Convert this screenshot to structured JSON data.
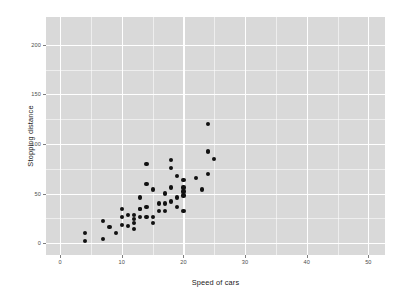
{
  "chart_data": {
    "type": "scatter",
    "title": "",
    "subtitle": "",
    "xlabel": "Speed of cars",
    "ylabel": "Stopping distance",
    "xlim": [
      -2.3,
      52.7
    ],
    "ylim": [
      -12,
      228
    ],
    "x_ticks": [
      0,
      10,
      20,
      30,
      40,
      50
    ],
    "y_ticks": [
      0,
      50,
      100,
      150,
      200
    ],
    "x_minor_ticks": [
      5,
      15,
      25,
      35,
      45
    ],
    "y_minor_ticks": [
      25,
      75,
      125,
      175
    ],
    "grid": true,
    "legend": "none",
    "panel_background": "#d9d9d9",
    "gridline_color": "#ffffff",
    "point_color": "#111111",
    "series": [
      {
        "name": "cars",
        "x": [
          4,
          4,
          7,
          7,
          8,
          9,
          10,
          10,
          10,
          11,
          11,
          12,
          12,
          12,
          12,
          13,
          13,
          13,
          13,
          14,
          14,
          14,
          14,
          15,
          15,
          15,
          16,
          16,
          17,
          17,
          17,
          18,
          18,
          18,
          18,
          19,
          19,
          19,
          20,
          20,
          20,
          20,
          20,
          22,
          23,
          24,
          24,
          24,
          24,
          25
        ],
        "y": [
          2,
          10,
          4,
          22,
          16,
          10,
          18,
          26,
          34,
          17,
          28,
          14,
          20,
          24,
          28,
          26,
          34,
          34,
          46,
          26,
          36,
          60,
          80,
          20,
          26,
          54,
          32,
          40,
          32,
          40,
          50,
          42,
          56,
          76,
          84,
          36,
          46,
          68,
          32,
          48,
          52,
          56,
          64,
          66,
          54,
          70,
          92,
          93,
          120,
          85
        ]
      }
    ]
  },
  "axis_labels": {
    "x_title": "Speed of cars",
    "y_title": "Stopping distance"
  }
}
